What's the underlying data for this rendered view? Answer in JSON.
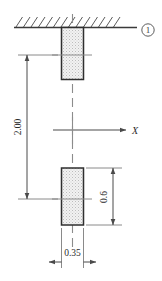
{
  "figure": {
    "type": "engineering-drawing",
    "title": "",
    "support_marker_label": "1",
    "axis_label": "X",
    "dimensions": [
      {
        "id": "length",
        "label": "2.00",
        "orientation": "vertical",
        "position": "left"
      },
      {
        "id": "block-height",
        "label": "0.6",
        "orientation": "vertical",
        "position": "right"
      },
      {
        "id": "block-width",
        "label": "0.35",
        "orientation": "horizontal",
        "position": "bottom"
      }
    ],
    "elements": {
      "ground_hatch": "fixed-support-hatching",
      "upper_block": "rectangular-mass-upper",
      "lower_block": "rectangular-mass-lower",
      "centerline": "vertical-dashed-centerline",
      "axis": "x-axis-arrow"
    },
    "colors": {
      "line": "#3a3a3a",
      "block_border": "#2f2f2f",
      "block_fill": "#ededed",
      "dim_line": "#555555",
      "text": "#2b2b2b"
    }
  }
}
